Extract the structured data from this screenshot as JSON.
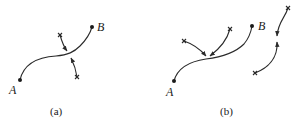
{
  "figure": {
    "panels": [
      {
        "id": "a",
        "caption": "(a)",
        "points": [
          {
            "label": "A",
            "x": 20,
            "y": 80
          },
          {
            "label": "B",
            "x": 92,
            "y": 27
          }
        ],
        "description": "Path from A to B crossed by a path between two x-marked points, with arrows converging on the intersection"
      },
      {
        "id": "b",
        "caption": "(b)",
        "points": [
          {
            "label": "A",
            "x": 174,
            "y": 81
          },
          {
            "label": "B",
            "x": 252,
            "y": 26
          }
        ],
        "description": "Path from A to B with two x-marked points sending arrows to a common point on the path; separate curve with two x-marked ends whose arrows meet in the middle"
      }
    ],
    "colors": {
      "stroke": "#2a2a2a",
      "background": "#ffffff"
    }
  }
}
